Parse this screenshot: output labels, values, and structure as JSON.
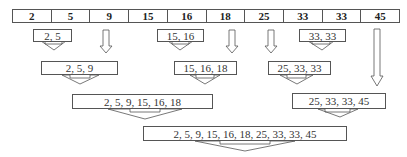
{
  "diagram": {
    "input_array": [
      "2",
      "5",
      "9",
      "15",
      "16",
      "18",
      "25",
      "33",
      "33",
      "45"
    ],
    "level1": [
      {
        "label": "2, 5",
        "type": "box"
      },
      {
        "label": "9",
        "type": "pass-through"
      },
      {
        "label": "15, 16",
        "type": "box"
      },
      {
        "label": "18",
        "type": "pass-through"
      },
      {
        "label": "25",
        "type": "pass-through"
      },
      {
        "label": "33, 33",
        "type": "box"
      },
      {
        "label": "45",
        "type": "pass-through"
      }
    ],
    "level2": [
      "2, 5, 9",
      "15, 16, 18",
      "25, 33, 33"
    ],
    "level3": [
      "2, 5, 9, 15, 16, 18",
      "25, 33, 33, 45"
    ],
    "level4": [
      "2, 5, 9, 15, 16, 18, 25, 33, 33, 45"
    ]
  }
}
